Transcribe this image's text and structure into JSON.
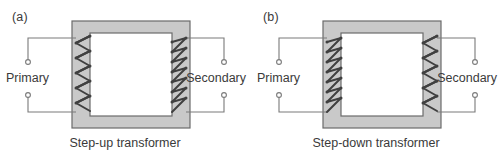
{
  "figure": {
    "width": 501,
    "height": 156,
    "background": "#ffffff",
    "core_fill": "#c9c9c9",
    "core_stroke": "#6b6b6b",
    "wire_color": "#404040",
    "lead_color": "#7a7a7a",
    "text_color": "#3a3a3a"
  },
  "panels": [
    {
      "id": "a",
      "label": "(a)",
      "caption": "Step-up transformer",
      "primary": {
        "label": "Primary",
        "turns": 5,
        "terminal_count": 2
      },
      "secondary": {
        "label": "Secondary",
        "turns": 7,
        "terminal_count": 2
      }
    },
    {
      "id": "b",
      "label": "(b)",
      "caption": "Step-down transformer",
      "primary": {
        "label": "Primary",
        "turns": 7,
        "terminal_count": 2
      },
      "secondary": {
        "label": "Secondary",
        "turns": 5,
        "terminal_count": 2
      }
    }
  ]
}
